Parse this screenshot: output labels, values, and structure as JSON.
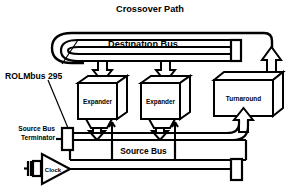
{
  "diagram": {
    "colors": {
      "line": "#000000",
      "background": "#ffffff",
      "fill": "#ffffff"
    },
    "labels": {
      "crossover_path": "Crossover Path",
      "destination_bus": "Destination Bus",
      "rolmbus": "ROLMbus 295",
      "expander_left": "Expander",
      "expander_right": "Expander",
      "turnaround": "Turnaround",
      "source_bus_terminator_line1": "Source Bus",
      "source_bus_terminator_line2": "Terminator",
      "clock": "Clock",
      "source_bus": "Source Bus"
    },
    "nodes": [
      {
        "name": "crossover-path",
        "kind": "path-loop",
        "label": "Crossover Path"
      },
      {
        "name": "destination-bus",
        "kind": "bus",
        "label": "Destination Bus"
      },
      {
        "name": "expander-left",
        "kind": "block-3d",
        "label": "Expander"
      },
      {
        "name": "expander-right",
        "kind": "block-3d",
        "label": "Expander"
      },
      {
        "name": "turnaround",
        "kind": "block-3d",
        "label": "Turnaround"
      },
      {
        "name": "source-bus",
        "kind": "bus",
        "label": "Source Bus"
      },
      {
        "name": "clock",
        "kind": "buffer-triangle",
        "label": "Clock"
      },
      {
        "name": "source-bus-terminator",
        "kind": "terminator",
        "label": "Source Bus Terminator"
      },
      {
        "name": "destination-bus-terminator",
        "kind": "terminator",
        "label": ""
      },
      {
        "name": "clock-line-terminator",
        "kind": "terminator",
        "label": ""
      }
    ],
    "connections": [
      {
        "from": "destination-bus",
        "to": "expander-left",
        "style": "hollow-arrow-down"
      },
      {
        "from": "destination-bus",
        "to": "expander-right",
        "style": "hollow-arrow-down"
      },
      {
        "from": "expander-left",
        "to": "source-bus",
        "style": "hollow-arrow-down"
      },
      {
        "from": "expander-right",
        "to": "source-bus",
        "style": "hollow-arrow-down"
      },
      {
        "from": "source-bus",
        "to": "expander-left",
        "style": "solid-arrow-up"
      },
      {
        "from": "source-bus",
        "to": "expander-right",
        "style": "solid-arrow-up"
      },
      {
        "from": "source-bus",
        "to": "turnaround",
        "style": "hollow-arrow-up"
      },
      {
        "from": "turnaround",
        "to": "crossover-path",
        "style": "hollow-arrow-up"
      },
      {
        "from": "clock",
        "to": "clock-line-terminator",
        "style": "line"
      },
      {
        "from": "source-bus-terminator",
        "to": "source-bus",
        "style": "line"
      }
    ],
    "leaders": [
      {
        "name": "leader-to-destination-bus",
        "from": "rolmbus-label",
        "to": "destination-bus"
      },
      {
        "name": "leader-to-source-bus-terminator",
        "from": "rolmbus-label",
        "to": "source-bus-terminator"
      }
    ]
  }
}
